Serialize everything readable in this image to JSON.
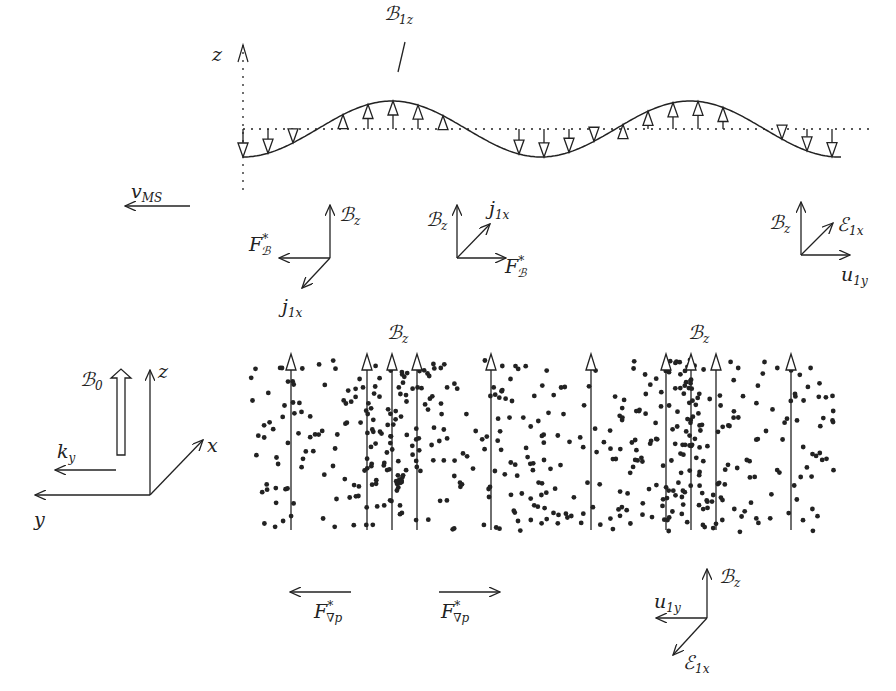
{
  "figure": {
    "type": "diagram",
    "colors": {
      "ink": "#222222",
      "background": "#ffffff"
    }
  },
  "wave_panel": {
    "axis_label": "z",
    "wave_label": {
      "base": "ℬ",
      "sub": "1z"
    },
    "velocity_label": {
      "base": "v",
      "sub": "MS"
    },
    "crests_x": [
      392,
      673
    ],
    "troughs_x": [
      243,
      532,
      842
    ],
    "baseline_y": 129,
    "amplitude": 28
  },
  "triads_top": [
    {
      "id": "left",
      "labels": [
        {
          "base": "ℬ",
          "sub": "z"
        },
        {
          "base": "F",
          "sup": "*",
          "sub": "ℬ"
        },
        {
          "base": "j",
          "sub": "1x"
        }
      ]
    },
    {
      "id": "middle",
      "labels": [
        {
          "base": "ℬ",
          "sub": "z"
        },
        {
          "base": "j",
          "sub": "1x"
        },
        {
          "base": "F",
          "sup": "*",
          "sub": "ℬ"
        }
      ]
    },
    {
      "id": "right",
      "labels": [
        {
          "base": "ℬ",
          "sub": "z"
        },
        {
          "base": "ℰ",
          "sub": "1x"
        },
        {
          "base": "u",
          "sub": "1y"
        }
      ]
    }
  ],
  "coordinate_system": {
    "axes": [
      "x",
      "y",
      "z"
    ],
    "field_label": {
      "base": "ℬ",
      "sub": "0"
    },
    "wavevector_label": {
      "base": "k",
      "sub": "y"
    }
  },
  "density_panels": [
    {
      "label": {
        "base": "ℬ",
        "sub": "z"
      },
      "center_x": 400,
      "field_lines_x": [
        291,
        367,
        392,
        417,
        491
      ]
    },
    {
      "label": {
        "base": "ℬ",
        "sub": "z"
      },
      "center_x": 690,
      "field_lines_x": [
        591,
        666,
        691,
        716,
        791
      ]
    }
  ],
  "pressure_forces": [
    {
      "direction": "left",
      "label": {
        "base": "F",
        "sup": "*",
        "sub": "∇p"
      }
    },
    {
      "direction": "right",
      "label": {
        "base": "F",
        "sup": "*",
        "sub": "∇p"
      }
    }
  ],
  "triad_bottom": {
    "labels": [
      {
        "base": "ℬ",
        "sub": "z"
      },
      {
        "base": "u",
        "sub": "1y"
      },
      {
        "base": "ℰ",
        "sub": "1x"
      }
    ]
  }
}
